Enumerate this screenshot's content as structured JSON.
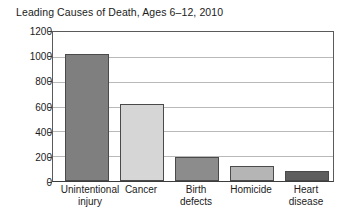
{
  "chart_data": {
    "type": "bar",
    "title": "Leading Causes of Death, Ages 6–12, 2010",
    "xlabel": "",
    "ylabel": "",
    "categories": [
      "Unintentional injury",
      "Cancer",
      "Birth defects",
      "Homicide",
      "Heart disease"
    ],
    "category_lines": [
      [
        "Unintentional",
        "injury"
      ],
      [
        "Cancer",
        ""
      ],
      [
        "Birth",
        "defects"
      ],
      [
        "Homicide",
        ""
      ],
      [
        "Heart",
        "disease"
      ]
    ],
    "values": [
      1020,
      620,
      195,
      120,
      80
    ],
    "ylim": [
      0,
      1200
    ],
    "yticks": [
      0,
      200,
      400,
      600,
      800,
      1000,
      1200
    ],
    "ytick_labels": [
      "0",
      "200",
      "400",
      "600",
      "800",
      "1000",
      "1200"
    ],
    "grid": "horizontal",
    "legend": "none",
    "bar_colors": [
      "#7f7f7f",
      "#d6d6d6",
      "#8c8c8c",
      "#b5b5b5",
      "#5e5e5e"
    ],
    "bar_edge_color": "#4a4a4a",
    "axis_color": "#3d3d3d",
    "gridline_color": "#b9b9b9",
    "background_color": "#ffffff",
    "text_color": "#1b1b1b"
  }
}
